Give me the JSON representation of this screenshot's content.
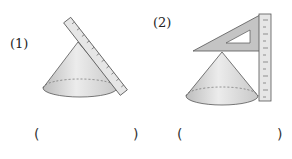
{
  "figures": [
    {
      "label": "(1)",
      "description": "cone with a ruler leaning along its slant edge"
    },
    {
      "label": "(2)",
      "description": "cone with a set square on the apex and a vertical ruler measuring height"
    }
  ],
  "answers": [
    {
      "open": "(",
      "close": ")"
    },
    {
      "open": "(",
      "close": ")"
    }
  ],
  "colors": {
    "cone_fill": "#d9d9d9",
    "ruler_fill": "#e6e6e6",
    "triangle_fill": "#c4c4c4",
    "stroke": "#555555"
  }
}
